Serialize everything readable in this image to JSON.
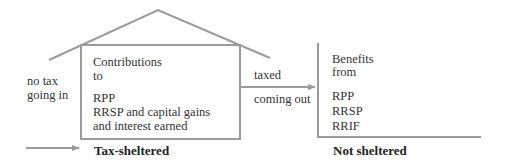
{
  "diagram": {
    "colors": {
      "line": "#9a9a9a",
      "text": "#333333",
      "background": "#ffffff"
    },
    "left_side": {
      "label_line1": "no tax",
      "label_line2": "going in"
    },
    "house_box": {
      "heading_line1": "Contributions",
      "heading_line2": "to",
      "items": [
        "RPP",
        "RRSP and capital gains",
        "and interest earned"
      ],
      "caption": "Tax-sheltered"
    },
    "middle_arrow": {
      "label_above": "taxed",
      "label_below": "coming out"
    },
    "right_bracket": {
      "heading_line1": "Benefits",
      "heading_line2": "from",
      "items": [
        "RPP",
        "RRSP",
        "RRIF"
      ],
      "caption": "Not sheltered"
    }
  }
}
